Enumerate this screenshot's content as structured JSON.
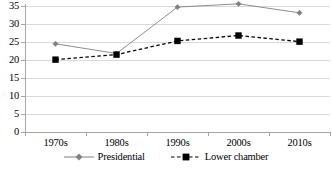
{
  "chart_data": {
    "type": "line",
    "title": "",
    "xlabel": "",
    "ylabel": "",
    "categories": [
      "1970s",
      "1980s",
      "1990s",
      "2000s",
      "2010s"
    ],
    "ylim": [
      0,
      35
    ],
    "yticks": [
      0,
      5,
      10,
      15,
      20,
      25,
      30,
      35
    ],
    "ytick_labels": [
      "0",
      "5",
      "10",
      "15",
      "20",
      "25",
      "30",
      "35"
    ],
    "grid": true,
    "legend_position": "bottom",
    "series": [
      {
        "name": "Presidential",
        "values": [
          24.5,
          21.8,
          34.7,
          35.6,
          33.1
        ],
        "color": "#808080",
        "line_style": "solid",
        "marker": "diamond"
      },
      {
        "name": "Lower chamber",
        "values": [
          20.1,
          21.5,
          25.3,
          26.8,
          25.1
        ],
        "color": "#000000",
        "line_style": "dashed",
        "marker": "square"
      }
    ]
  },
  "legend": {
    "items": [
      {
        "label": "Presidential"
      },
      {
        "label": "Lower chamber"
      }
    ]
  }
}
